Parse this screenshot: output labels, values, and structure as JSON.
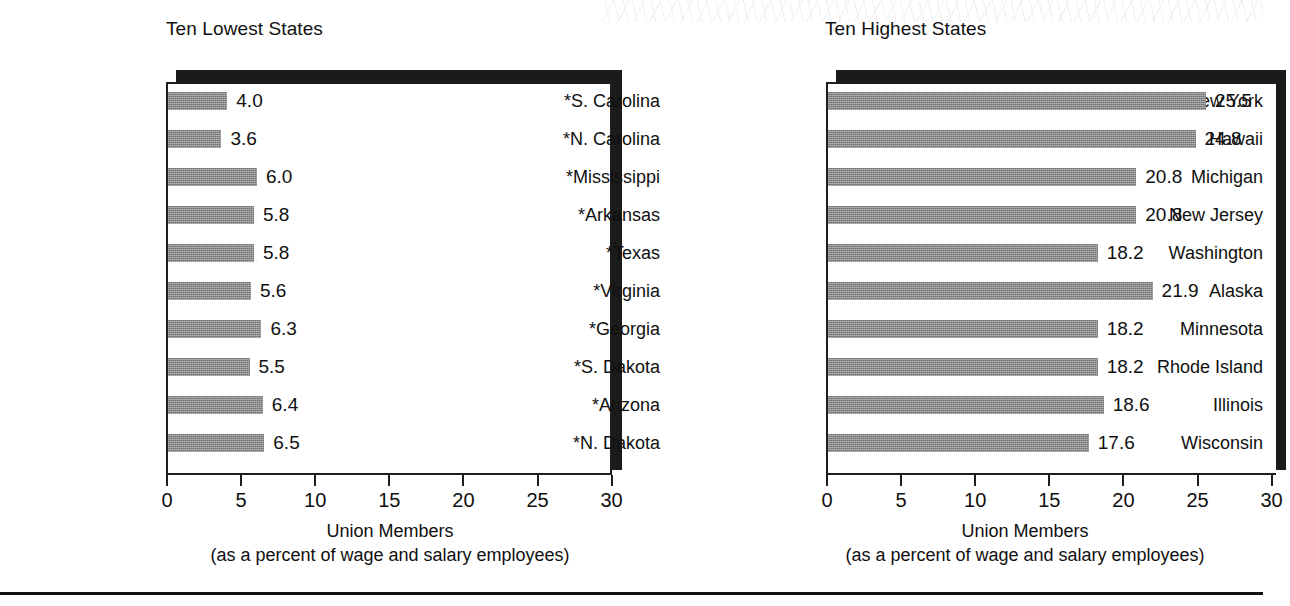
{
  "colors": {
    "bar_fill": "#8e8e8e",
    "frame_line": "#1e1e1e",
    "shadow": "#1b1b1b",
    "text": "#101010",
    "background": "#ffffff"
  },
  "bottom_rule": "",
  "charts": [
    {
      "id": "ten-lowest-states",
      "title": "Ten Lowest States",
      "axis_label_line1": "Union Members",
      "axis_label_line2": "(as a percent of wage and salary employees)",
      "ticks": [
        "0",
        "5",
        "10",
        "15",
        "20",
        "25",
        "30"
      ]
    },
    {
      "id": "ten-highest-states",
      "title": "Ten Highest States",
      "axis_label_line1": "Union Members",
      "axis_label_line2": "(as a percent of wage and salary employees)",
      "ticks": [
        "0",
        "5",
        "10",
        "15",
        "20",
        "25",
        "30"
      ]
    }
  ],
  "chart_data": [
    {
      "type": "bar",
      "orientation": "horizontal",
      "title": "Ten Lowest States",
      "xlabel": "Union Members (as a percent of wage and salary employees)",
      "ylabel": "",
      "xlim": [
        0,
        30
      ],
      "xticks": [
        0,
        5,
        10,
        15,
        20,
        25,
        30
      ],
      "grid": false,
      "legend": "none",
      "categories": [
        "*S. Carolina",
        "*N. Carolina",
        "*Mississippi",
        "*Arkansas",
        "*Texas",
        "*Virginia",
        "*Georgia",
        "*S. Dakota",
        "*Arizona",
        "*N. Dakota"
      ],
      "values": [
        4.0,
        3.6,
        6.0,
        5.8,
        5.8,
        5.6,
        6.3,
        5.5,
        6.4,
        6.5
      ],
      "value_labels": [
        "4.0",
        "3.6",
        "6.0",
        "5.8",
        "5.8",
        "5.6",
        "6.3",
        "5.5",
        "6.4",
        "6.5"
      ]
    },
    {
      "type": "bar",
      "orientation": "horizontal",
      "title": "Ten Highest States",
      "xlabel": "Union Members (as a percent of wage and salary employees)",
      "ylabel": "",
      "xlim": [
        0,
        30
      ],
      "xticks": [
        0,
        5,
        10,
        15,
        20,
        25,
        30
      ],
      "grid": false,
      "legend": "none",
      "categories": [
        "New York",
        "Hawaii",
        "Michigan",
        "New Jersey",
        "Washington",
        "Alaska",
        "Minnesota",
        "Rhode Island",
        "Illinois",
        "Wisconsin"
      ],
      "values": [
        25.5,
        24.8,
        20.8,
        20.8,
        18.2,
        21.9,
        18.2,
        18.2,
        18.6,
        17.6
      ],
      "value_labels": [
        "25.5",
        "24.8",
        "20.8",
        "20.8",
        "18.2",
        "21.9",
        "18.2",
        "18.2",
        "18.6",
        "17.6"
      ]
    }
  ]
}
